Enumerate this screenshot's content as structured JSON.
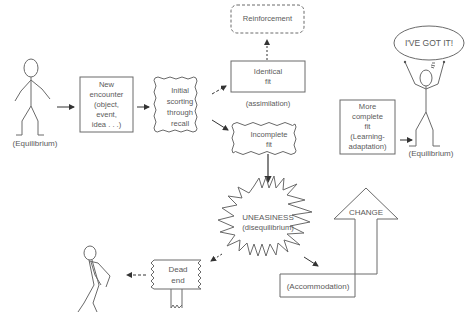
{
  "diagram": {
    "nodes": {
      "equilibrium_start": "(Equilibrium)",
      "new_encounter": [
        "New",
        "encounter",
        "(object,",
        "event,",
        "idea . . .)"
      ],
      "initial_sorting": [
        "Initial",
        "scorting",
        "through",
        "recall"
      ],
      "reinforcement": "Reinforcement",
      "identical_fit": [
        "Identical",
        "fit"
      ],
      "assimilation": "(assimilation)",
      "incomplete_fit": [
        "Incomplete",
        "fit"
      ],
      "uneasiness": "UNEASINESS",
      "disequilibrium": "(disequilibrium)",
      "dead_end": [
        "Dead",
        "end"
      ],
      "change": "CHANGE",
      "accommodation": "(Accommodation)",
      "more_complete_fit": [
        "More",
        "complete",
        "fit",
        "(Learning-",
        "adaptation)"
      ],
      "speech_bubble": "I'VE GOT IT!",
      "equilibrium_end": "(Equilibrium)"
    },
    "colors": {
      "stroke": "#6a6a6a",
      "text": "#5a5a5a",
      "background": "#ffffff"
    }
  }
}
